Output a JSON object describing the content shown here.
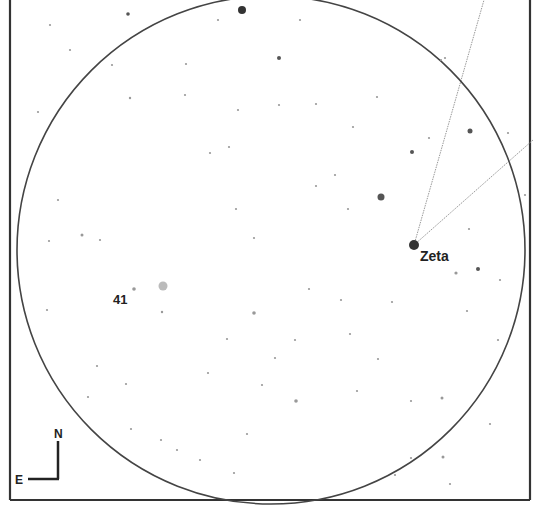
{
  "chart_data": {
    "type": "star-finder-chart",
    "title": "",
    "field_of_view": {
      "shape": "circle",
      "center": [
        271,
        250
      ],
      "radius": 254
    },
    "frame": {
      "left": 10,
      "right": 530,
      "bottom": 500,
      "top": 0
    },
    "orientation": {
      "north_label": "N",
      "east_label": "E"
    },
    "labels": [
      {
        "text": "Zeta",
        "x": 420,
        "y": 261
      },
      {
        "text": "41",
        "x": 113,
        "y": 304
      }
    ],
    "lines": [
      {
        "from": [
          414,
          245
        ],
        "to": [
          484,
          0
        ]
      },
      {
        "from": [
          414,
          245
        ],
        "to": [
          533,
          140
        ]
      }
    ],
    "stars": [
      {
        "x": 242,
        "y": 10,
        "r": 4,
        "mag": "bright"
      },
      {
        "x": 414,
        "y": 245,
        "r": 5,
        "mag": "bright"
      },
      {
        "x": 381,
        "y": 197,
        "r": 3.5,
        "mag": "medium"
      },
      {
        "x": 163,
        "y": 286,
        "r": 4.5,
        "mag": "medium-faint",
        "color": "#bbbbbb"
      },
      {
        "x": 470,
        "y": 131,
        "r": 2.5,
        "mag": "medium"
      },
      {
        "x": 412,
        "y": 152,
        "r": 2,
        "mag": "medium"
      },
      {
        "x": 279,
        "y": 58,
        "r": 2,
        "mag": "medium"
      },
      {
        "x": 128,
        "y": 14,
        "r": 1.8,
        "mag": "medium"
      },
      {
        "x": 478,
        "y": 269,
        "r": 2,
        "mag": "medium"
      },
      {
        "x": 456,
        "y": 273,
        "r": 1.6,
        "mag": "faint"
      },
      {
        "x": 134,
        "y": 289,
        "r": 1.8,
        "mag": "faint"
      },
      {
        "x": 254,
        "y": 313,
        "r": 1.8,
        "mag": "faint"
      },
      {
        "x": 296,
        "y": 401,
        "r": 1.8,
        "mag": "faint"
      },
      {
        "x": 162,
        "y": 312,
        "r": 1.2,
        "mag": "faint"
      },
      {
        "x": 130,
        "y": 98,
        "r": 1.2,
        "mag": "faint"
      },
      {
        "x": 185,
        "y": 95,
        "r": 1.1,
        "mag": "faint"
      },
      {
        "x": 112,
        "y": 65,
        "r": 1.1,
        "mag": "faint"
      },
      {
        "x": 82,
        "y": 235,
        "r": 1.5,
        "mag": "faint"
      },
      {
        "x": 58,
        "y": 200,
        "r": 1.1,
        "mag": "faint"
      },
      {
        "x": 49,
        "y": 241,
        "r": 1.1,
        "mag": "faint"
      },
      {
        "x": 316,
        "y": 186,
        "r": 1.1,
        "mag": "faint"
      },
      {
        "x": 348,
        "y": 209,
        "r": 1.1,
        "mag": "faint"
      },
      {
        "x": 236,
        "y": 209,
        "r": 1.1,
        "mag": "faint"
      },
      {
        "x": 254,
        "y": 238,
        "r": 1.1,
        "mag": "faint"
      },
      {
        "x": 238,
        "y": 110,
        "r": 1.1,
        "mag": "faint"
      },
      {
        "x": 279,
        "y": 105,
        "r": 1.1,
        "mag": "faint"
      },
      {
        "x": 316,
        "y": 104,
        "r": 1.1,
        "mag": "faint"
      },
      {
        "x": 229,
        "y": 147,
        "r": 1.1,
        "mag": "faint"
      },
      {
        "x": 210,
        "y": 153,
        "r": 1.1,
        "mag": "faint"
      },
      {
        "x": 353,
        "y": 127,
        "r": 1.1,
        "mag": "faint"
      },
      {
        "x": 335,
        "y": 175,
        "r": 1.1,
        "mag": "faint"
      },
      {
        "x": 309,
        "y": 289,
        "r": 1.1,
        "mag": "faint"
      },
      {
        "x": 378,
        "y": 359,
        "r": 1.1,
        "mag": "faint"
      },
      {
        "x": 350,
        "y": 334,
        "r": 1.1,
        "mag": "faint"
      },
      {
        "x": 357,
        "y": 391,
        "r": 1.1,
        "mag": "faint"
      },
      {
        "x": 200,
        "y": 460,
        "r": 1.1,
        "mag": "faint"
      },
      {
        "x": 161,
        "y": 440,
        "r": 1.1,
        "mag": "faint"
      },
      {
        "x": 131,
        "y": 429,
        "r": 1.1,
        "mag": "faint"
      },
      {
        "x": 443,
        "y": 457,
        "r": 1.5,
        "mag": "faint"
      },
      {
        "x": 442,
        "y": 398,
        "r": 1.5,
        "mag": "faint"
      },
      {
        "x": 411,
        "y": 401,
        "r": 1.1,
        "mag": "faint"
      },
      {
        "x": 490,
        "y": 424,
        "r": 1.1,
        "mag": "faint"
      },
      {
        "x": 411,
        "y": 458,
        "r": 1.1,
        "mag": "faint"
      },
      {
        "x": 445,
        "y": 58,
        "r": 1.1,
        "mag": "faint"
      },
      {
        "x": 508,
        "y": 133,
        "r": 1.1,
        "mag": "faint"
      },
      {
        "x": 525,
        "y": 195,
        "r": 1.1,
        "mag": "faint"
      },
      {
        "x": 429,
        "y": 138,
        "r": 1.1,
        "mag": "faint"
      },
      {
        "x": 441,
        "y": 60,
        "r": 1.1,
        "mag": "faint"
      },
      {
        "x": 50,
        "y": 25,
        "r": 1.1,
        "mag": "faint"
      },
      {
        "x": 100,
        "y": 240,
        "r": 1.1,
        "mag": "faint"
      },
      {
        "x": 47,
        "y": 310,
        "r": 1.1,
        "mag": "faint"
      },
      {
        "x": 262,
        "y": 385,
        "r": 1.1,
        "mag": "faint"
      },
      {
        "x": 341,
        "y": 300,
        "r": 1.1,
        "mag": "faint"
      },
      {
        "x": 392,
        "y": 302,
        "r": 1.1,
        "mag": "faint"
      },
      {
        "x": 247,
        "y": 434,
        "r": 1.1,
        "mag": "faint"
      },
      {
        "x": 177,
        "y": 450,
        "r": 1.1,
        "mag": "faint"
      },
      {
        "x": 234,
        "y": 473,
        "r": 1.1,
        "mag": "faint"
      },
      {
        "x": 126,
        "y": 384,
        "r": 1.1,
        "mag": "faint"
      },
      {
        "x": 88,
        "y": 397,
        "r": 1.1,
        "mag": "faint"
      },
      {
        "x": 97,
        "y": 366,
        "r": 1.1,
        "mag": "faint"
      },
      {
        "x": 38,
        "y": 112,
        "r": 1.1,
        "mag": "faint"
      },
      {
        "x": 70,
        "y": 50,
        "r": 1.1,
        "mag": "faint"
      },
      {
        "x": 300,
        "y": 20,
        "r": 1.1,
        "mag": "faint"
      },
      {
        "x": 218,
        "y": 20,
        "r": 1.1,
        "mag": "faint"
      },
      {
        "x": 186,
        "y": 64,
        "r": 1.1,
        "mag": "faint"
      },
      {
        "x": 377,
        "y": 97,
        "r": 1.1,
        "mag": "faint"
      },
      {
        "x": 295,
        "y": 340,
        "r": 1.1,
        "mag": "faint"
      },
      {
        "x": 275,
        "y": 358,
        "r": 1.1,
        "mag": "faint"
      },
      {
        "x": 227,
        "y": 339,
        "r": 1.1,
        "mag": "faint"
      },
      {
        "x": 208,
        "y": 373,
        "r": 1.1,
        "mag": "faint"
      },
      {
        "x": 467,
        "y": 311,
        "r": 1.1,
        "mag": "faint"
      },
      {
        "x": 498,
        "y": 340,
        "r": 1.1,
        "mag": "faint"
      },
      {
        "x": 469,
        "y": 229,
        "r": 1.1,
        "mag": "faint"
      },
      {
        "x": 500,
        "y": 280,
        "r": 1.1,
        "mag": "faint"
      },
      {
        "x": 395,
        "y": 475,
        "r": 1.1,
        "mag": "faint"
      },
      {
        "x": 450,
        "y": 484,
        "r": 1.1,
        "mag": "faint"
      }
    ]
  },
  "labels": {
    "zeta": "Zeta",
    "star41": "41",
    "north": "N",
    "east": "E"
  },
  "colors": {
    "background": "#ffffff",
    "frame": "#333333",
    "circle": "#444444",
    "star": "#555555",
    "line": "#999999",
    "text": "#222222"
  }
}
